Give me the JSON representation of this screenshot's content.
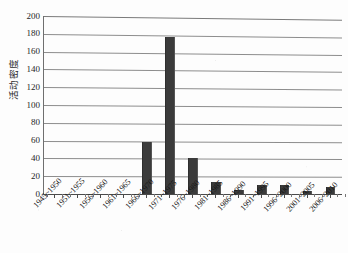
{
  "chart_data": {
    "type": "bar",
    "title": "",
    "xlabel": "",
    "ylabel": "活动密度",
    "ylim": [
      0,
      200
    ],
    "ytick_step": 20,
    "yticks": [
      "200",
      "180",
      "160",
      "140",
      "120",
      "100",
      "80",
      "60",
      "40",
      "20",
      "0"
    ],
    "grid": "horizontal",
    "legend": "none",
    "bar_color": "#3b3b3b",
    "gridline_color": "#8d8d8d",
    "axis_color": "#4a4a4a",
    "background_color": "#fdfdfd",
    "categories": [
      "1945~1950",
      "1951~1955",
      "1956~1960",
      "1961~1965",
      "1966~1970",
      "1971~1975",
      "1976~1980",
      "1981~1985",
      "1986~1990",
      "1991~1995",
      "1996~2000",
      "2001~2005",
      "2006~2010"
    ],
    "values": [
      0,
      0,
      0,
      0,
      59,
      176,
      41,
      14,
      5,
      10,
      10,
      3,
      8
    ]
  }
}
